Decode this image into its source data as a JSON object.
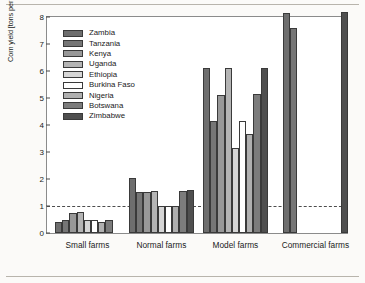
{
  "chart_data": {
    "type": "bar",
    "title": "",
    "xlabel": "",
    "ylabel": "Corn yield [tons per hectare]",
    "ylim": [
      0,
      8
    ],
    "yticks": [
      0,
      1,
      2,
      3,
      4,
      5,
      6,
      7,
      8
    ],
    "ytick_labels": [
      "0",
      "1",
      "2",
      "3",
      "4",
      "5",
      "6",
      "7",
      "8"
    ],
    "grid": false,
    "legend_position": "upper-left-inside",
    "categories": [
      "Small farms",
      "Normal farms",
      "Model farms",
      "Commercial farms"
    ],
    "annotations": [
      {
        "type": "hline",
        "y": 1,
        "style": "dashed",
        "label": ""
      }
    ],
    "series": [
      {
        "name": "Zambia",
        "color": "#6e6e6e",
        "values": [
          0.4,
          2.05,
          6.1,
          8.15
        ]
      },
      {
        "name": "Tanzania",
        "color": "#767676",
        "values": [
          0.47,
          1.53,
          4.15,
          7.6
        ]
      },
      {
        "name": "Kenya",
        "color": "#989898",
        "values": [
          0.75,
          1.53,
          5.12,
          null
        ]
      },
      {
        "name": "Uganda",
        "color": "#b4b4b4",
        "values": [
          0.76,
          1.55,
          6.1,
          null
        ]
      },
      {
        "name": "Ethiopia",
        "color": "#d6d6d6",
        "values": [
          0.47,
          1.0,
          3.15,
          null
        ]
      },
      {
        "name": "Burkina Faso",
        "color": "#ffffff",
        "values": [
          0.5,
          1.0,
          4.15,
          null
        ]
      },
      {
        "name": "Nigeria",
        "color": "#b0b0b0",
        "values": [
          0.41,
          1.0,
          3.65,
          null
        ]
      },
      {
        "name": "Botswana",
        "color": "#7c7c7c",
        "values": [
          0.5,
          1.55,
          5.15,
          null
        ]
      },
      {
        "name": "Zimbabwe",
        "color": "#4f4f4f",
        "values": [
          null,
          1.58,
          6.12,
          8.18
        ]
      }
    ]
  },
  "legend": {
    "items": [
      {
        "label": "Zambia",
        "color": "#6e6e6e"
      },
      {
        "label": "Tanzania",
        "color": "#767676"
      },
      {
        "label": "Kenya",
        "color": "#989898"
      },
      {
        "label": "Uganda",
        "color": "#b4b4b4"
      },
      {
        "label": "Ethiopia",
        "color": "#d6d6d6"
      },
      {
        "label": "Burkina Faso",
        "color": "#ffffff"
      },
      {
        "label": "Nigeria",
        "color": "#b0b0b0"
      },
      {
        "label": "Botswana",
        "color": "#7c7c7c"
      },
      {
        "label": "Zimbabwe",
        "color": "#4f4f4f"
      }
    ]
  },
  "axis": {
    "y_title": "Corn yield [tons per hectare]",
    "y_tick_labels": [
      "0",
      "1",
      "2",
      "3",
      "4",
      "5",
      "6",
      "7",
      "8"
    ],
    "x_tick_labels": [
      "Small farms",
      "Normal farms",
      "Model farms",
      "Commercial farms"
    ]
  }
}
